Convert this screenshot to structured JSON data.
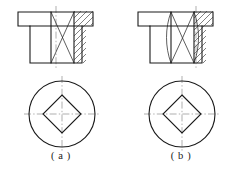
{
  "figure": {
    "kind": "engineering-drawing",
    "background_color": "#ffffff",
    "line_color": "#1a1a1a",
    "centerline_color": "#8d8d8d",
    "hatch_color": "#2a2a2a",
    "canvas": {
      "width": 240,
      "height": 171
    }
  },
  "captions": {
    "left": "( a )",
    "right": "( b )"
  },
  "variants": [
    {
      "id": "a",
      "caption": "( a )",
      "intersection_line_style": "straight",
      "front_view": {
        "name": "sectional-front-view",
        "flange": {
          "x": 18,
          "y": 12,
          "width": 75,
          "height": 14
        },
        "body": {
          "x": 30,
          "y": 26,
          "width": 52,
          "height": 37
        },
        "bore_left_x": 51,
        "bore_right_x": 74,
        "hatched_band": {
          "x": 74,
          "y": 12,
          "width": 19,
          "height": 51
        },
        "centerline_x": 56
      },
      "plan_view": {
        "name": "circular-plan-view",
        "center_x": 62,
        "center_y": 114,
        "circle_radius": 33,
        "diamond_half_diagonal": 19
      }
    },
    {
      "id": "b",
      "caption": "( b )",
      "intersection_line_style": "curved",
      "front_view": {
        "name": "sectional-front-view",
        "flange": {
          "x": 138,
          "y": 12,
          "width": 75,
          "height": 14
        },
        "body": {
          "x": 150,
          "y": 26,
          "width": 52,
          "height": 37
        },
        "bore_left_x": 171,
        "bore_right_x": 194,
        "hatched_band": {
          "x": 194,
          "y": 12,
          "width": 19,
          "height": 51
        },
        "centerline_x": 196
      },
      "plan_view": {
        "name": "circular-plan-view",
        "center_x": 182,
        "center_y": 114,
        "circle_radius": 33,
        "diamond_half_diagonal": 19
      }
    }
  ]
}
